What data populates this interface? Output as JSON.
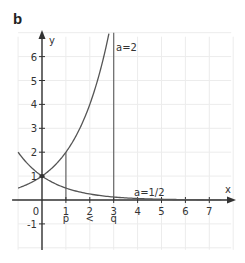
{
  "panel_label": "b",
  "colors": {
    "axis": "#333333",
    "curve": "#555555",
    "grid": "#ececec",
    "guide": "#666666",
    "text": "#333333"
  },
  "chart_data": {
    "type": "line",
    "title": "",
    "xlabel": "x",
    "ylabel": "y",
    "xlim": [
      -1,
      8
    ],
    "ylim": [
      -2,
      7
    ],
    "grid": true,
    "x_ticks": [
      0,
      1,
      2,
      3,
      4,
      5,
      6,
      7
    ],
    "x_tick_labels": [
      "0",
      "1",
      "2",
      "3",
      "4",
      "5",
      "6",
      "7"
    ],
    "y_ticks": [
      -1,
      1,
      2,
      3,
      4,
      5,
      6
    ],
    "y_tick_labels": [
      "-1",
      "1",
      "2",
      "3",
      "4",
      "5",
      "6"
    ],
    "series": [
      {
        "name": "a=2",
        "function": "2^x",
        "x": [
          -1,
          -0.5,
          0,
          0.5,
          1,
          1.5,
          2,
          2.5,
          2.8
        ],
        "values": [
          0.5,
          0.71,
          1,
          1.41,
          2,
          2.83,
          4,
          5.66,
          6.96
        ]
      },
      {
        "name": "a=1/2",
        "function": "(1/2)^x",
        "x": [
          -1,
          -0.5,
          0,
          0.5,
          1,
          2,
          3,
          4,
          5,
          6,
          7.5
        ],
        "values": [
          2,
          1.41,
          1,
          0.71,
          0.5,
          0.25,
          0.125,
          0.0625,
          0.031,
          0.016,
          0.006
        ]
      }
    ],
    "guides": [
      {
        "x": 1,
        "from": 0,
        "to": 2
      },
      {
        "x": 3,
        "from": 0,
        "to": 7
      }
    ],
    "annotations": [
      {
        "text": "a=2",
        "x": 3.1,
        "y": 6.4
      },
      {
        "text": "a=1/2",
        "x": 3.85,
        "y": 0.35
      },
      {
        "text": "p",
        "x": 1,
        "y": -0.75
      },
      {
        "text": "<",
        "x": 2,
        "y": -0.75
      },
      {
        "text": "q",
        "x": 3,
        "y": -0.75
      }
    ]
  }
}
